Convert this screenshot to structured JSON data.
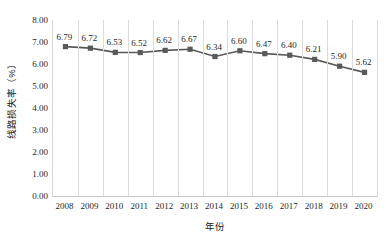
{
  "chart_data": {
    "type": "line",
    "title": "",
    "xlabel": "年份",
    "ylabel": "线路损失率（%）",
    "categories": [
      "2008",
      "2009",
      "2010",
      "2011",
      "2012",
      "2013",
      "2014",
      "2015",
      "2016",
      "2017",
      "2018",
      "2019",
      "2020"
    ],
    "values": [
      6.79,
      6.72,
      6.53,
      6.52,
      6.62,
      6.67,
      6.34,
      6.6,
      6.47,
      6.4,
      6.21,
      5.9,
      5.62
    ],
    "data_labels": [
      "6.79",
      "6.72",
      "6.53",
      "6.52",
      "6.62",
      "6.67",
      "6.34",
      "6.60",
      "6.47",
      "6.40",
      "6.21",
      "5.90",
      "5.62"
    ],
    "ylim": [
      0.0,
      8.0
    ],
    "ytick_step": 1.0,
    "ytick_labels": [
      "0.00",
      "1.00",
      "2.00",
      "3.00",
      "4.00",
      "5.00",
      "6.00",
      "7.00",
      "8.00"
    ],
    "ytick_values": [
      0.0,
      1.0,
      2.0,
      3.0,
      4.0,
      5.0,
      6.0,
      7.0,
      8.0
    ],
    "grid": {
      "vertical": true,
      "horizontal": false
    },
    "legend": {
      "visible": false,
      "position": "none"
    },
    "series_color": "#595959",
    "grid_color": "#dcdcdc",
    "marker": "square",
    "data_label_color": "#1f1f1f"
  }
}
